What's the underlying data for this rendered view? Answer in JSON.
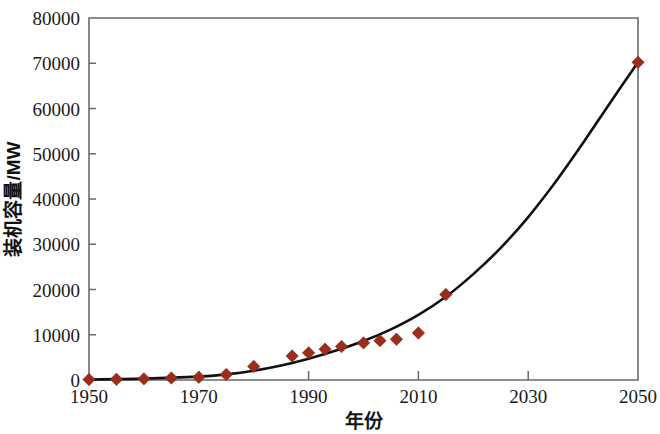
{
  "chart_data": {
    "type": "scatter",
    "title": "",
    "xlabel": "年份",
    "ylabel": "装机容量/MW",
    "xlim": [
      1950,
      2050
    ],
    "ylim": [
      0,
      80000
    ],
    "grid": false,
    "legend": null,
    "xticks": [
      1950,
      1970,
      1990,
      2010,
      2030,
      2050
    ],
    "xtick_labels": [
      "1950",
      "1970",
      "1990",
      "2010",
      "2030",
      "2050"
    ],
    "yticks": [
      0,
      10000,
      20000,
      30000,
      40000,
      50000,
      60000,
      70000,
      80000
    ],
    "ytick_labels": [
      "0",
      "10000",
      "20000",
      "30000",
      "40000",
      "50000",
      "60000",
      "70000",
      "80000"
    ],
    "marker_color": "#9c2d1c",
    "curve_color": "#111111",
    "marker_shape": "diamond",
    "series": [
      {
        "name": "观测装机容量",
        "type": "scatter",
        "points": [
          {
            "x": 1950,
            "y": 100
          },
          {
            "x": 1955,
            "y": 150
          },
          {
            "x": 1960,
            "y": 250
          },
          {
            "x": 1965,
            "y": 450
          },
          {
            "x": 1970,
            "y": 600
          },
          {
            "x": 1975,
            "y": 1200
          },
          {
            "x": 1980,
            "y": 3000
          },
          {
            "x": 1987,
            "y": 5300
          },
          {
            "x": 1990,
            "y": 6000
          },
          {
            "x": 1993,
            "y": 6800
          },
          {
            "x": 1996,
            "y": 7400
          },
          {
            "x": 2000,
            "y": 8200
          },
          {
            "x": 2003,
            "y": 8700
          },
          {
            "x": 2006,
            "y": 9000
          },
          {
            "x": 2010,
            "y": 10400
          },
          {
            "x": 2015,
            "y": 18900
          },
          {
            "x": 2050,
            "y": 70200
          }
        ]
      },
      {
        "name": "拟合曲线",
        "type": "line",
        "points": [
          {
            "x": 1950,
            "y": 120
          },
          {
            "x": 1960,
            "y": 300
          },
          {
            "x": 1970,
            "y": 750
          },
          {
            "x": 1975,
            "y": 1250
          },
          {
            "x": 1980,
            "y": 2050
          },
          {
            "x": 1985,
            "y": 3200
          },
          {
            "x": 1990,
            "y": 4700
          },
          {
            "x": 1995,
            "y": 6500
          },
          {
            "x": 2000,
            "y": 8600
          },
          {
            "x": 2005,
            "y": 11200
          },
          {
            "x": 2010,
            "y": 14400
          },
          {
            "x": 2015,
            "y": 18400
          },
          {
            "x": 2020,
            "y": 23400
          },
          {
            "x": 2025,
            "y": 29200
          },
          {
            "x": 2030,
            "y": 36000
          },
          {
            "x": 2035,
            "y": 43800
          },
          {
            "x": 2040,
            "y": 52400
          },
          {
            "x": 2045,
            "y": 61400
          },
          {
            "x": 2050,
            "y": 70200
          }
        ]
      }
    ]
  }
}
